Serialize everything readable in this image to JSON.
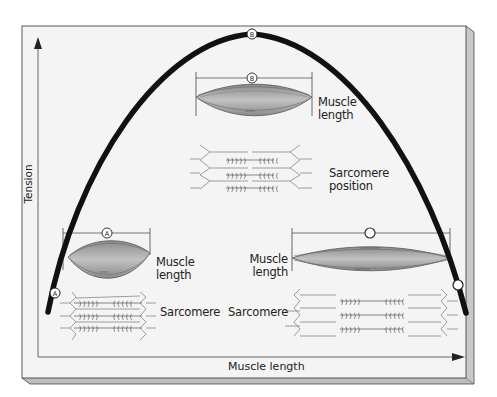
{
  "diagram": {
    "axes": {
      "y_label": "Tension",
      "x_label": "Muscle length"
    },
    "curve": {
      "shape": "inverted-parabola",
      "color": "#111111",
      "markers": [
        {
          "id": "A",
          "position": "left-low",
          "label": "A"
        },
        {
          "id": "B",
          "position": "peak",
          "label": "B"
        },
        {
          "id": "C",
          "position": "right-low",
          "label": "C"
        }
      ]
    },
    "panels": {
      "A": {
        "marker": "A",
        "muscle_label": "Muscle length",
        "muscle_label_line1": "Muscle",
        "muscle_label_line2": "length",
        "sarcomere_label": "Sarcomere",
        "state": "short (overlapping filaments)"
      },
      "B": {
        "marker": "B",
        "muscle_label_line1": "Muscle",
        "muscle_label_line2": "length",
        "sarcomere_label_line1": "Sarcomere",
        "sarcomere_label_line2": "position",
        "state": "optimal"
      },
      "C": {
        "marker": "C",
        "muscle_label_line1": "Muscle",
        "muscle_label_line2": "length",
        "sarcomere_label": "Sarcomere",
        "state": "stretched (little overlap)"
      }
    },
    "colors": {
      "background": "#ffffff",
      "panel": "#f3f3f3",
      "panel_edge": "#cfcfcf",
      "frame": "#555555",
      "curve": "#111111",
      "muscle_fill": "#9a9a9a",
      "muscle_stripe": "#555555",
      "filament": "#777777"
    }
  }
}
